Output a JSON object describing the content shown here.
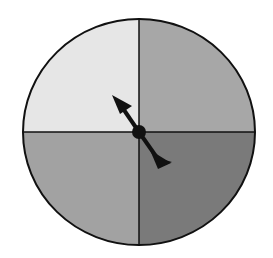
{
  "diagram": {
    "type": "spinner",
    "sections": [
      {
        "position": "top-left",
        "color": "#e6e6e6"
      },
      {
        "position": "top-right",
        "color": "#a7a7a7"
      },
      {
        "position": "bottom-left",
        "color": "#a2a2a2"
      },
      {
        "position": "bottom-right",
        "color": "#7a7a7a"
      }
    ],
    "pointer": {
      "direction": "top-left",
      "color": "#111111"
    },
    "outline_color": "#111111"
  }
}
